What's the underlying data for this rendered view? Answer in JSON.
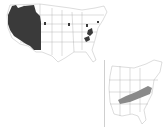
{
  "figure": {
    "type": "distribution-map",
    "top_caption": "",
    "main_map": {
      "region": "Contiguous United States",
      "fill_color": "#3a3a3a",
      "outline_color": "#9a9a9a",
      "shaded_areas": [
        "Pacific Northwest / Far West (WA, OR, ID, CA, NV, western MT)",
        "Small patches: Wyoming, Minnesota, Michigan, Ohio, Pennsylvania, West Virginia, Virginia, New York"
      ]
    },
    "inset_map": {
      "region": "Eastern United States",
      "fill_color": "#8a8a8a",
      "outline_color": "#9a9a9a",
      "shaded_areas": [
        "Appalachian band: KY, TN, WV, VA"
      ]
    }
  }
}
